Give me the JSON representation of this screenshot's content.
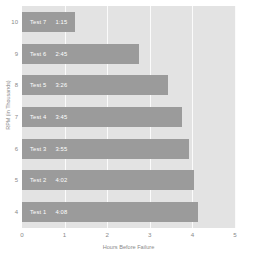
{
  "chart_data": {
    "type": "bar",
    "orientation": "horizontal",
    "title": "",
    "xlabel": "Hours Before Failure",
    "ylabel": "RPM (in Thousands)",
    "xlim": [
      0,
      5
    ],
    "ylim": [
      3.5,
      10.5
    ],
    "xticks": [
      "0",
      "1",
      "2",
      "3",
      "4",
      "5"
    ],
    "yticks": [
      "10",
      "9",
      "8",
      "7",
      "6",
      "5",
      "4"
    ],
    "grid": "vertical-only",
    "legend": "none",
    "bar_color": "#9b9b9b",
    "plot_background": "#e3e3e3",
    "gridline_color": "#fbfbfb",
    "categories": [
      10,
      9,
      8,
      7,
      6,
      5,
      4
    ],
    "values": [
      1.25,
      2.75,
      3.43,
      3.75,
      3.92,
      4.03,
      4.13
    ],
    "bars": [
      {
        "rpm": "10",
        "name": "Test 7",
        "time": "1:15",
        "value": 1.25
      },
      {
        "rpm": "9",
        "name": "Test 6",
        "time": "2:45",
        "value": 2.75
      },
      {
        "rpm": "8",
        "name": "Test 5",
        "time": "3:26",
        "value": 3.43
      },
      {
        "rpm": "7",
        "name": "Test 4",
        "time": "3:45",
        "value": 3.75
      },
      {
        "rpm": "6",
        "name": "Test 3",
        "time": "3:55",
        "value": 3.92
      },
      {
        "rpm": "5",
        "name": "Test 2",
        "time": "4:02",
        "value": 4.03
      },
      {
        "rpm": "4",
        "name": "Test 1",
        "time": "4:08",
        "value": 4.13
      }
    ]
  }
}
